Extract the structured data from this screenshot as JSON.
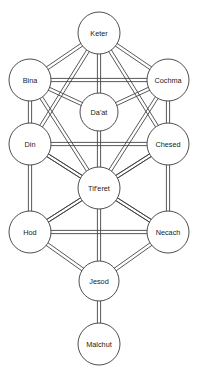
{
  "diagram": {
    "type": "node-link-graph",
    "background_color": "#ffffff",
    "line_color": "#3b3b3b",
    "node_fill_color": "#ffffff",
    "text_color": "#1a1a1a",
    "edge_style": "double-parallel-line",
    "edge_gap": 3.2,
    "canvas": {
      "width": 198,
      "height": 373
    },
    "nodes": [
      {
        "id": "keter",
        "label": "Keter",
        "x": 99,
        "y": 33,
        "r": 21
      },
      {
        "id": "bina",
        "label": "Bina",
        "x": 30,
        "y": 80,
        "r": 21
      },
      {
        "id": "cochma",
        "label": "Cochma",
        "x": 168,
        "y": 80,
        "r": 21
      },
      {
        "id": "daat",
        "label": "Da'at",
        "x": 99,
        "y": 112,
        "r": 19
      },
      {
        "id": "din",
        "label": "Din",
        "x": 30,
        "y": 144,
        "r": 21
      },
      {
        "id": "chesed",
        "label": "Chesed",
        "x": 168,
        "y": 144,
        "r": 21
      },
      {
        "id": "tiferet",
        "label": "Tif'eret",
        "x": 99,
        "y": 188,
        "r": 21
      },
      {
        "id": "hod",
        "label": "Hod",
        "x": 30,
        "y": 232,
        "r": 21
      },
      {
        "id": "necach",
        "label": "Necach",
        "x": 168,
        "y": 232,
        "r": 21
      },
      {
        "id": "jesod",
        "label": "Jesod",
        "x": 99,
        "y": 281,
        "r": 20
      },
      {
        "id": "malchut",
        "label": "Malchut",
        "x": 99,
        "y": 344,
        "r": 21
      }
    ],
    "edges": [
      {
        "from": "keter",
        "to": "bina"
      },
      {
        "from": "keter",
        "to": "cochma"
      },
      {
        "from": "keter",
        "to": "daat"
      },
      {
        "from": "keter",
        "to": "din"
      },
      {
        "from": "keter",
        "to": "chesed"
      },
      {
        "from": "bina",
        "to": "cochma"
      },
      {
        "from": "bina",
        "to": "din"
      },
      {
        "from": "bina",
        "to": "daat"
      },
      {
        "from": "bina",
        "to": "tiferet"
      },
      {
        "from": "cochma",
        "to": "chesed"
      },
      {
        "from": "cochma",
        "to": "daat"
      },
      {
        "from": "cochma",
        "to": "tiferet"
      },
      {
        "from": "daat",
        "to": "tiferet"
      },
      {
        "from": "din",
        "to": "chesed"
      },
      {
        "from": "din",
        "to": "tiferet"
      },
      {
        "from": "din",
        "to": "hod"
      },
      {
        "from": "din",
        "to": "necach"
      },
      {
        "from": "chesed",
        "to": "tiferet"
      },
      {
        "from": "chesed",
        "to": "necach"
      },
      {
        "from": "chesed",
        "to": "hod"
      },
      {
        "from": "tiferet",
        "to": "hod"
      },
      {
        "from": "tiferet",
        "to": "necach"
      },
      {
        "from": "tiferet",
        "to": "jesod"
      },
      {
        "from": "hod",
        "to": "necach"
      },
      {
        "from": "hod",
        "to": "jesod"
      },
      {
        "from": "necach",
        "to": "jesod"
      },
      {
        "from": "jesod",
        "to": "malchut"
      }
    ]
  }
}
